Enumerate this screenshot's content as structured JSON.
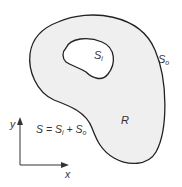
{
  "diagram": {
    "region_fill": "#efefef",
    "stroke_color": "#222222",
    "labels": {
      "inner_boundary": "S",
      "inner_boundary_sub": "i",
      "outer_boundary": "S",
      "outer_boundary_sub": "o",
      "region": "R",
      "equation_S": "S = S",
      "equation_i": "i",
      "equation_plus": " + S",
      "equation_o": "o",
      "axis_y": "y",
      "axis_x": "x"
    }
  }
}
